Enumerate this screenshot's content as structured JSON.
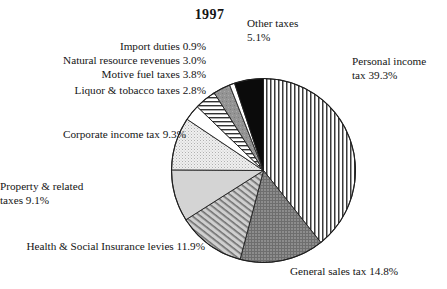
{
  "chart_data": {
    "type": "pie",
    "title": "1997",
    "xlabel": "",
    "ylabel": "",
    "legend_position": "callout-labels",
    "grid": false,
    "units": "percent",
    "start_angle_deg": 0,
    "direction": "clockwise",
    "categories": [
      "Personal income tax",
      "General sales tax",
      "Health & Social Insurance levies",
      "Property & related taxes",
      "Corporate income tax",
      "Liquor & tobacco taxes",
      "Motive fuel taxes",
      "Natural resource revenues",
      "Import duties",
      "Other taxes"
    ],
    "values": [
      39.3,
      14.8,
      11.9,
      9.1,
      9.3,
      2.8,
      3.8,
      3.0,
      0.9,
      5.1
    ],
    "slices": [
      {
        "label": "Personal income tax",
        "value": 39.3,
        "value_text": "39.3%",
        "pattern": "vertical-stripes",
        "fill": "#ffffff",
        "ink": "#2b2b2b"
      },
      {
        "label": "General sales tax",
        "value": 14.8,
        "value_text": "14.8%",
        "pattern": "dark-crosshatch",
        "fill": "#8a8a8a",
        "ink": "#5a5a5a"
      },
      {
        "label": "Health & Social Insurance levies",
        "value": 11.9,
        "value_text": "11.9%",
        "pattern": "diagonal-hatch",
        "fill": "#b9b9b9",
        "ink": "#777777"
      },
      {
        "label": "Property & related taxes",
        "value": 9.1,
        "value_text": "9.1%",
        "pattern": "solid-light-gray",
        "fill": "#d2d2d2",
        "ink": "#d2d2d2"
      },
      {
        "label": "Corporate income tax",
        "value": 9.3,
        "value_text": "9.3%",
        "pattern": "fine-dots",
        "fill": "#ececec",
        "ink": "#bdbdbd"
      },
      {
        "label": "Liquor & tobacco taxes",
        "value": 2.8,
        "value_text": "2.8%",
        "pattern": "white",
        "fill": "#ffffff",
        "ink": "#ffffff"
      },
      {
        "label": "Motive fuel taxes",
        "value": 3.8,
        "value_text": "3.8%",
        "pattern": "horizontal-lines",
        "fill": "#ffffff",
        "ink": "#333333"
      },
      {
        "label": "Natural resource revenues",
        "value": 3.0,
        "value_text": "3.0%",
        "pattern": "medium-gray",
        "fill": "#909090",
        "ink": "#909090"
      },
      {
        "label": "Import duties",
        "value": 0.9,
        "value_text": "0.9%",
        "pattern": "white",
        "fill": "#ffffff",
        "ink": "#ffffff"
      },
      {
        "label": "Other taxes",
        "value": 5.1,
        "value_text": "5.1%",
        "pattern": "black",
        "fill": "#0a0a0a",
        "ink": "#0a0a0a"
      }
    ],
    "callouts": {
      "other_taxes": {
        "line1": "Other taxes",
        "line2": "5.1%"
      },
      "import_duties": {
        "text": "Import duties 0.9%"
      },
      "natural_resource": {
        "text": "Natural resource revenues 3.0%"
      },
      "motive_fuel": {
        "text": "Motive fuel taxes 3.8%"
      },
      "liquor_tobacco": {
        "text": "Liquor & tobacco taxes 2.8%"
      },
      "corporate_income": {
        "text": "Corporate income tax 9.3%"
      },
      "property_related": {
        "line1": "Property & related",
        "line2": "taxes 9.1%"
      },
      "health_social": {
        "text": "Health & Social Insurance levies 11.9%"
      },
      "general_sales": {
        "text": "General sales tax 14.8%"
      },
      "personal_income": {
        "line1": "Personal income",
        "line2": "tax 39.3%"
      }
    }
  },
  "colors": {
    "page_background": "#ffffff",
    "text": "#141414",
    "outline": "#222222"
  }
}
